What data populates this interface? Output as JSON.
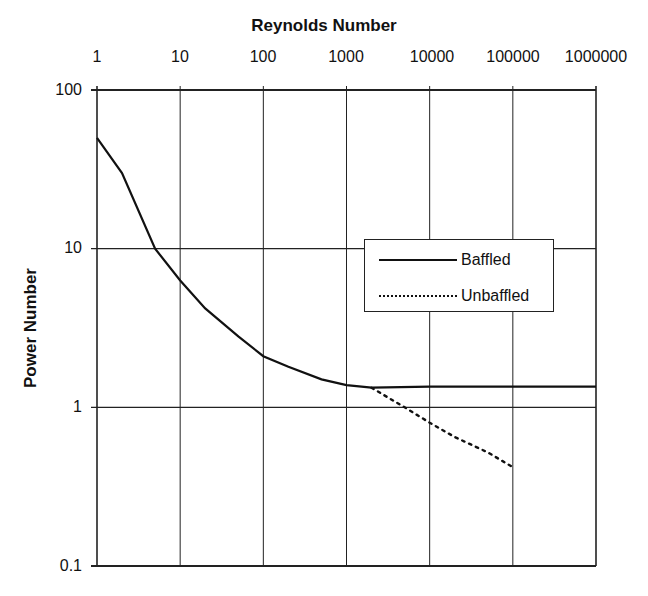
{
  "chart_data": {
    "type": "line",
    "title": "",
    "xlabel": "Reynolds Number",
    "ylabel": "Power Number",
    "xscale": "log",
    "yscale": "log",
    "xlim": [
      1,
      1000000
    ],
    "ylim": [
      0.1,
      100
    ],
    "x_axis_position": "top",
    "grid": true,
    "legend_position": "right-center inside",
    "x_tick_labels": [
      "1",
      "10",
      "100",
      "1000",
      "10000",
      "100000",
      "1000000"
    ],
    "y_tick_labels": [
      "100",
      "10",
      "1",
      "0.1"
    ],
    "series": [
      {
        "name": "Baffled",
        "style": "solid",
        "x": [
          1,
          2,
          5,
          10,
          20,
          50,
          100,
          200,
          500,
          1000,
          2000,
          10000,
          100000,
          1000000
        ],
        "y": [
          50,
          30,
          10,
          6.3,
          4.2,
          2.8,
          2.1,
          1.8,
          1.5,
          1.38,
          1.33,
          1.35,
          1.35,
          1.35
        ]
      },
      {
        "name": "Unbaffled",
        "style": "dotted",
        "x": [
          2000,
          5000,
          10000,
          20000,
          50000,
          100000
        ],
        "y": [
          1.33,
          1.0,
          0.8,
          0.65,
          0.52,
          0.42
        ]
      }
    ]
  },
  "labels": {
    "xlabel": "Reynolds Number",
    "ylabel": "Power Number",
    "xticks": [
      "1",
      "10",
      "100",
      "1000",
      "10000",
      "100000",
      "1000000"
    ],
    "yticks": [
      "100",
      "10",
      "1",
      "0.1"
    ],
    "legend": [
      "Baffled",
      "Unbaffled"
    ]
  }
}
